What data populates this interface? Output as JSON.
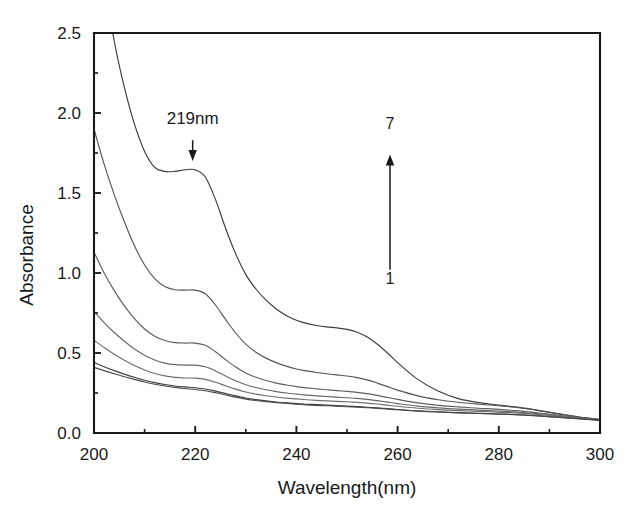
{
  "chart_data": {
    "type": "line",
    "title": "",
    "xlabel": "Wavelength(nm)",
    "ylabel": "Absorbance",
    "xlim": [
      200,
      300
    ],
    "ylim": [
      0.0,
      2.5
    ],
    "xticks": [
      200,
      220,
      240,
      260,
      280,
      300
    ],
    "xtick_labels": [
      "200",
      "220",
      "240",
      "260",
      "280",
      "300"
    ],
    "xminor_ticks": [
      210,
      230,
      250,
      270,
      290
    ],
    "yticks": [
      0.0,
      0.5,
      1.0,
      1.5,
      2.0,
      2.5
    ],
    "ytick_labels": [
      "0.0",
      "0.5",
      "1.0",
      "1.5",
      "2.0",
      "2.5"
    ],
    "yminor_ticks": [
      0.25,
      0.75,
      1.25,
      1.75,
      2.25
    ],
    "grid": false,
    "legend": false,
    "x": [
      200,
      202,
      204,
      206,
      208,
      210,
      212,
      214,
      216,
      218,
      220,
      222,
      224,
      226,
      228,
      230,
      232,
      234,
      236,
      238,
      240,
      242,
      244,
      246,
      248,
      250,
      252,
      254,
      256,
      258,
      260,
      264,
      268,
      272,
      276,
      280,
      284,
      288,
      292,
      296,
      300
    ],
    "series": [
      {
        "name": "7",
        "color": "#3c3c3c",
        "clipped_at_top": true,
        "values": [
          3.35,
          2.85,
          2.45,
          2.16,
          1.93,
          1.76,
          1.66,
          1.635,
          1.635,
          1.645,
          1.645,
          1.6,
          1.46,
          1.28,
          1.12,
          0.99,
          0.9,
          0.83,
          0.775,
          0.735,
          0.705,
          0.685,
          0.672,
          0.663,
          0.657,
          0.648,
          0.63,
          0.6,
          0.555,
          0.5,
          0.44,
          0.335,
          0.262,
          0.215,
          0.19,
          0.175,
          0.16,
          0.14,
          0.118,
          0.098,
          0.085
        ]
      },
      {
        "name": "6",
        "color": "#555555",
        "clipped_at_top": false,
        "values": [
          1.9,
          1.68,
          1.49,
          1.32,
          1.17,
          1.05,
          0.965,
          0.915,
          0.895,
          0.893,
          0.893,
          0.87,
          0.8,
          0.71,
          0.625,
          0.555,
          0.505,
          0.468,
          0.44,
          0.418,
          0.4,
          0.388,
          0.378,
          0.37,
          0.363,
          0.356,
          0.346,
          0.332,
          0.312,
          0.29,
          0.268,
          0.232,
          0.208,
          0.192,
          0.18,
          0.17,
          0.158,
          0.14,
          0.12,
          0.1,
          0.085
        ]
      },
      {
        "name": "5",
        "color": "#5e5e5e",
        "clipped_at_top": false,
        "values": [
          1.13,
          1.0,
          0.89,
          0.795,
          0.715,
          0.65,
          0.605,
          0.578,
          0.565,
          0.562,
          0.562,
          0.548,
          0.508,
          0.458,
          0.412,
          0.375,
          0.348,
          0.328,
          0.312,
          0.3,
          0.29,
          0.282,
          0.276,
          0.27,
          0.265,
          0.26,
          0.254,
          0.246,
          0.235,
          0.222,
          0.21,
          0.188,
          0.173,
          0.163,
          0.155,
          0.148,
          0.138,
          0.125,
          0.11,
          0.095,
          0.082
        ]
      },
      {
        "name": "4",
        "color": "#666666",
        "clipped_at_top": false,
        "values": [
          0.76,
          0.69,
          0.628,
          0.573,
          0.525,
          0.486,
          0.456,
          0.437,
          0.427,
          0.424,
          0.424,
          0.414,
          0.388,
          0.356,
          0.326,
          0.302,
          0.284,
          0.27,
          0.259,
          0.25,
          0.243,
          0.237,
          0.232,
          0.228,
          0.224,
          0.22,
          0.216,
          0.21,
          0.202,
          0.193,
          0.184,
          0.168,
          0.157,
          0.149,
          0.143,
          0.137,
          0.13,
          0.12,
          0.107,
          0.094,
          0.082
        ]
      },
      {
        "name": "3",
        "color": "#6e6e6e",
        "clipped_at_top": false,
        "values": [
          0.58,
          0.534,
          0.492,
          0.455,
          0.422,
          0.394,
          0.372,
          0.357,
          0.348,
          0.344,
          0.343,
          0.335,
          0.317,
          0.295,
          0.274,
          0.256,
          0.243,
          0.233,
          0.225,
          0.218,
          0.213,
          0.208,
          0.204,
          0.201,
          0.198,
          0.195,
          0.191,
          0.187,
          0.181,
          0.174,
          0.167,
          0.155,
          0.146,
          0.14,
          0.135,
          0.13,
          0.124,
          0.115,
          0.104,
          0.092,
          0.081
        ]
      },
      {
        "name": "2",
        "color": "#3f3f3f",
        "clipped_at_top": false,
        "values": [
          0.44,
          0.414,
          0.39,
          0.368,
          0.348,
          0.33,
          0.315,
          0.303,
          0.294,
          0.288,
          0.283,
          0.275,
          0.262,
          0.247,
          0.232,
          0.219,
          0.209,
          0.201,
          0.194,
          0.189,
          0.184,
          0.18,
          0.177,
          0.174,
          0.171,
          0.168,
          0.165,
          0.161,
          0.157,
          0.152,
          0.147,
          0.138,
          0.132,
          0.127,
          0.123,
          0.119,
          0.114,
          0.107,
          0.098,
          0.089,
          0.08
        ]
      },
      {
        "name": "1",
        "color": "#4a4a4a",
        "clipped_at_top": false,
        "values": [
          0.41,
          0.39,
          0.37,
          0.352,
          0.335,
          0.319,
          0.305,
          0.294,
          0.285,
          0.278,
          0.272,
          0.264,
          0.252,
          0.238,
          0.224,
          0.212,
          0.203,
          0.196,
          0.19,
          0.185,
          0.18,
          0.176,
          0.173,
          0.17,
          0.167,
          0.164,
          0.161,
          0.158,
          0.154,
          0.15,
          0.145,
          0.137,
          0.131,
          0.126,
          0.122,
          0.118,
          0.113,
          0.106,
          0.097,
          0.088,
          0.079
        ]
      }
    ],
    "annotations": [
      {
        "id": "peak-219",
        "text": "219nm",
        "text_x": 219.5,
        "text_y": 1.93,
        "arrow_from": [
          219.5,
          1.83
        ],
        "arrow_to": [
          219.5,
          1.7
        ]
      },
      {
        "id": "series-direction",
        "top_label": "7",
        "bottom_label": "1",
        "arrow_x": 258.5,
        "arrow_from_y": 1.02,
        "arrow_to_y": 1.74,
        "top_label_y": 1.9,
        "bottom_label_y": 0.93
      }
    ]
  }
}
